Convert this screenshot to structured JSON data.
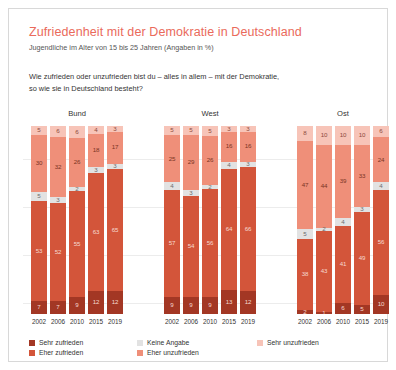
{
  "header": {
    "title": "Zufriedenheit mit der Demokratie in Deutschland",
    "subtitle": "Jugendliche im Alter von 15 bis 25 Jahren (Angaben in %)",
    "question_line1": "Wie zufrieden oder unzufrieden bist du – alles in allem – mit der Demokratie,",
    "question_line2": "so wie sie in Deutschland besteht?",
    "title_color": "#ea6a5b"
  },
  "legend": {
    "items": [
      {
        "label": "Sehr zufrieden",
        "color": "#a33724"
      },
      {
        "label": "Keine Angabe",
        "color": "#e2e2e2"
      },
      {
        "label": "Sehr unzufrieden",
        "color": "#f7c4b8"
      },
      {
        "label": "Eher zufrieden",
        "color": "#d3553a"
      },
      {
        "label": "Eher unzufrieden",
        "color": "#ef8f79"
      }
    ]
  },
  "chart_data": {
    "type": "bar",
    "title": "Zufriedenheit mit der Demokratie in Deutschland",
    "subtitle": "Jugendliche im Alter von 15 bis 25 Jahren (Angaben in %)",
    "xlabel": "",
    "ylabel": "",
    "ylim": [
      0,
      100
    ],
    "grid": false,
    "stacked": true,
    "stack_order_bottom_to_top": [
      "Sehr zufrieden",
      "Eher zufrieden",
      "Keine Angabe",
      "Eher unzufrieden",
      "Sehr unzufrieden"
    ],
    "legend_position": "bottom",
    "categories": [
      "2002",
      "2006",
      "2010",
      "2015",
      "2019"
    ],
    "groups": [
      {
        "name": "Bund",
        "bars": [
          {
            "year": "2002",
            "sehr_zufrieden": 7,
            "eher_zufrieden": 53,
            "keine_angabe": 5,
            "eher_unzufrieden": 30,
            "sehr_unzufrieden": 5
          },
          {
            "year": "2006",
            "sehr_zufrieden": 7,
            "eher_zufrieden": 52,
            "keine_angabe": 3,
            "eher_unzufrieden": 32,
            "sehr_unzufrieden": 6
          },
          {
            "year": "2010",
            "sehr_zufrieden": 9,
            "eher_zufrieden": 55,
            "keine_angabe": 2,
            "eher_unzufrieden": 26,
            "sehr_unzufrieden": 6
          },
          {
            "year": "2015",
            "sehr_zufrieden": 12,
            "eher_zufrieden": 63,
            "keine_angabe": 3,
            "eher_unzufrieden": 18,
            "sehr_unzufrieden": 4
          },
          {
            "year": "2019",
            "sehr_zufrieden": 12,
            "eher_zufrieden": 65,
            "keine_angabe": 3,
            "eher_unzufrieden": 17,
            "sehr_unzufrieden": 3
          }
        ]
      },
      {
        "name": "West",
        "bars": [
          {
            "year": "2002",
            "sehr_zufrieden": 9,
            "eher_zufrieden": 57,
            "keine_angabe": 4,
            "eher_unzufrieden": 25,
            "sehr_unzufrieden": 5
          },
          {
            "year": "2006",
            "sehr_zufrieden": 9,
            "eher_zufrieden": 54,
            "keine_angabe": 3,
            "eher_unzufrieden": 29,
            "sehr_unzufrieden": 5
          },
          {
            "year": "2010",
            "sehr_zufrieden": 9,
            "eher_zufrieden": 56,
            "keine_angabe": 2,
            "eher_unzufrieden": 26,
            "sehr_unzufrieden": 5
          },
          {
            "year": "2015",
            "sehr_zufrieden": 13,
            "eher_zufrieden": 64,
            "keine_angabe": 4,
            "eher_unzufrieden": 16,
            "sehr_unzufrieden": 3
          },
          {
            "year": "2019",
            "sehr_zufrieden": 12,
            "eher_zufrieden": 66,
            "keine_angabe": 3,
            "eher_unzufrieden": 16,
            "sehr_unzufrieden": 3
          }
        ]
      },
      {
        "name": "Ost",
        "bars": [
          {
            "year": "2002",
            "sehr_zufrieden": 2,
            "eher_zufrieden": 38,
            "keine_angabe": 5,
            "eher_unzufrieden": 47,
            "sehr_unzufrieden": 8
          },
          {
            "year": "2006",
            "sehr_zufrieden": 1,
            "eher_zufrieden": 43,
            "keine_angabe": 2,
            "eher_unzufrieden": 44,
            "sehr_unzufrieden": 10
          },
          {
            "year": "2010",
            "sehr_zufrieden": 6,
            "eher_zufrieden": 41,
            "keine_angabe": 4,
            "eher_unzufrieden": 39,
            "sehr_unzufrieden": 10
          },
          {
            "year": "2015",
            "sehr_zufrieden": 5,
            "eher_zufrieden": 49,
            "keine_angabe": 3,
            "eher_unzufrieden": 33,
            "sehr_unzufrieden": 10
          },
          {
            "year": "2019",
            "sehr_zufrieden": 10,
            "eher_zufrieden": 56,
            "keine_angabe": 4,
            "eher_unzufrieden": 24,
            "sehr_unzufrieden": 6
          }
        ]
      }
    ]
  }
}
